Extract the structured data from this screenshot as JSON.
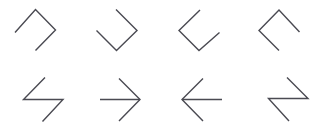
{
  "figure": {
    "name": "polyline-shape-grid",
    "width": 322,
    "height": 134,
    "background_color": "#ffffff",
    "stroke_color": "#4a4a52",
    "stroke_width": 1.4,
    "rows": 2,
    "columns": 4,
    "shapes": [
      {
        "id": "shape-r1c1",
        "row": 1,
        "column": 1,
        "label": "hook-open-right-down",
        "segments": 3,
        "points": "15,32 35,10 55,30 36,50",
        "orientation_deg": 0
      },
      {
        "id": "shape-r1c2",
        "row": 1,
        "column": 2,
        "label": "hook-open-up-right",
        "segments": 3,
        "points": "116,10 137,30 117,50 97,31"
      },
      {
        "id": "shape-r1c3",
        "row": 1,
        "column": 3,
        "label": "hook-open-left-down",
        "segments": 3,
        "points": "200,11 179,31 199,51 219,33"
      },
      {
        "id": "shape-r1c4",
        "row": 1,
        "column": 4,
        "label": "hook-open-down-left",
        "segments": 3,
        "points": "262,51 262,51 262,51 262,51",
        "points_actual": "299,32 279,11 259,31 279,51"
      },
      {
        "id": "shape-r2c1",
        "row": 2,
        "column": 1,
        "label": "zigzag-z-left",
        "segments": 3,
        "points": "45,78 24,100 63,100 43,121"
      },
      {
        "id": "shape-r2c2",
        "row": 2,
        "column": 2,
        "label": "arrow-right",
        "segments": 3,
        "points": "119,79 140,100 100,100 140,100",
        "points_actual": "119,79 140,100 119,121"
      },
      {
        "id": "shape-r2c3",
        "row": 2,
        "column": 3,
        "label": "arrow-left",
        "segments": 3,
        "points": "203,79 182,100 203,121"
      },
      {
        "id": "shape-r2c4",
        "row": 2,
        "column": 4,
        "label": "zigzag-z-right",
        "segments": 3,
        "points": "287,78 308,99 269,99 289,121"
      }
    ]
  }
}
